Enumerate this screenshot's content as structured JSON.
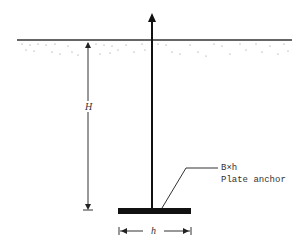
{
  "diagram": {
    "labels": {
      "depth": "H",
      "width": "h",
      "plate_dims": "B×h",
      "plate_name": "Plate anchor"
    },
    "colors": {
      "line": "#111111",
      "soil_dots": "#777777",
      "text": "#333333"
    }
  }
}
